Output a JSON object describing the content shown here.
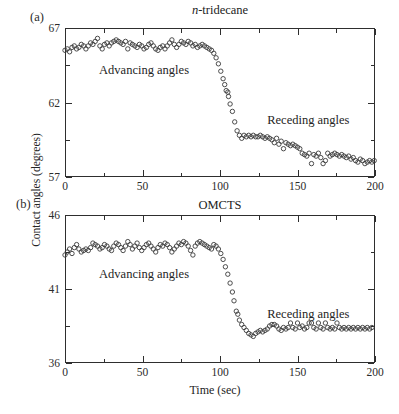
{
  "figure": {
    "xlabel": "Time (sec)",
    "ylabel": "Contact angles (degrees)",
    "background": "#ffffff",
    "ink_color": "#2e2e2e",
    "marker_color": "#3a3a3a"
  },
  "chart_data": [
    {
      "type": "scatter",
      "panel_label": "(a)",
      "title": {
        "italic": "n",
        "rest": "-tridecane"
      },
      "xlim": [
        0,
        200
      ],
      "ylim": [
        57,
        67
      ],
      "x_major_ticks": [
        0,
        50,
        100,
        150,
        200
      ],
      "x_minor_ticks": [
        25,
        75,
        125,
        175
      ],
      "y_major_ticks": [
        57,
        62,
        67
      ],
      "y_minor_ticks": [
        59.5,
        64.5
      ],
      "grid": false,
      "annotations": [
        {
          "text": "Advancing angles",
          "t": 51,
          "value": 64.2
        },
        {
          "text": "Receding angles",
          "t": 157,
          "value": 60.8
        }
      ],
      "points": [
        [
          0,
          65.5
        ],
        [
          1.5,
          65.6
        ],
        [
          3,
          65.4
        ],
        [
          4.5,
          65.7
        ],
        [
          6,
          65.8
        ],
        [
          7.5,
          65.6
        ],
        [
          9,
          65.7
        ],
        [
          10.5,
          65.9
        ],
        [
          12,
          65.8
        ],
        [
          13.5,
          65.6
        ],
        [
          15,
          65.8
        ],
        [
          16.5,
          66.0
        ],
        [
          18,
          65.9
        ],
        [
          19.5,
          66.1
        ],
        [
          21,
          66.3
        ],
        [
          22.5,
          65.8
        ],
        [
          24,
          65.6
        ],
        [
          25.5,
          65.9
        ],
        [
          27,
          66.0
        ],
        [
          28.5,
          65.8
        ],
        [
          30,
          66.0
        ],
        [
          31.5,
          66.1
        ],
        [
          33,
          66.2
        ],
        [
          34.5,
          66.1
        ],
        [
          36,
          66.0
        ],
        [
          37.5,
          65.9
        ],
        [
          39,
          66.1
        ],
        [
          40.5,
          65.6
        ],
        [
          42,
          66.0
        ],
        [
          43.5,
          65.9
        ],
        [
          45,
          65.8
        ],
        [
          46.5,
          65.7
        ],
        [
          48,
          65.9
        ],
        [
          49.5,
          65.8
        ],
        [
          51,
          65.6
        ],
        [
          52.5,
          65.7
        ],
        [
          54,
          65.9
        ],
        [
          55.5,
          66.0
        ],
        [
          57,
          65.8
        ],
        [
          58.5,
          65.6
        ],
        [
          60,
          65.5
        ],
        [
          61.5,
          65.7
        ],
        [
          63,
          65.8
        ],
        [
          64.5,
          65.6
        ],
        [
          66,
          65.8
        ],
        [
          67.5,
          66.0
        ],
        [
          69,
          66.2
        ],
        [
          70.5,
          65.9
        ],
        [
          72,
          65.7
        ],
        [
          73.5,
          65.9
        ],
        [
          75,
          66.1
        ],
        [
          76.5,
          66.0
        ],
        [
          78,
          65.9
        ],
        [
          79.5,
          66.1
        ],
        [
          81,
          66.0
        ],
        [
          82.5,
          65.8
        ],
        [
          84,
          65.9
        ],
        [
          85.5,
          65.7
        ],
        [
          87,
          65.8
        ],
        [
          88.5,
          65.9
        ],
        [
          90,
          65.8
        ],
        [
          91.5,
          65.7
        ],
        [
          93,
          65.6
        ],
        [
          94.5,
          65.5
        ],
        [
          96,
          65.3
        ],
        [
          97.5,
          65.0
        ],
        [
          99,
          64.6
        ],
        [
          100.5,
          64.1
        ],
        [
          102,
          63.6
        ],
        [
          103,
          63.2
        ],
        [
          104,
          62.8
        ],
        [
          105,
          62.7
        ],
        [
          105.5,
          62.4
        ],
        [
          106.5,
          61.9
        ],
        [
          108,
          61.4
        ],
        [
          109.5,
          60.7
        ],
        [
          111,
          60.1
        ],
        [
          112.5,
          59.8
        ],
        [
          114,
          59.6
        ],
        [
          115.5,
          59.8
        ],
        [
          117,
          59.7
        ],
        [
          118.5,
          59.8
        ],
        [
          120,
          59.7
        ],
        [
          121.5,
          59.8
        ],
        [
          123,
          59.7
        ],
        [
          124.5,
          59.7
        ],
        [
          126,
          59.8
        ],
        [
          127.5,
          59.7
        ],
        [
          129,
          59.6
        ],
        [
          130.5,
          59.7
        ],
        [
          132,
          59.6
        ],
        [
          133.5,
          59.5
        ],
        [
          135,
          59.3
        ],
        [
          136.5,
          59.6
        ],
        [
          138,
          59.2
        ],
        [
          139.5,
          59.4
        ],
        [
          141,
          58.9
        ],
        [
          142.5,
          59.3
        ],
        [
          144,
          59.2
        ],
        [
          145.5,
          59.1
        ],
        [
          147,
          59.2
        ],
        [
          148.5,
          59.1
        ],
        [
          150,
          59.0
        ],
        [
          151.5,
          58.9
        ],
        [
          153,
          58.6
        ],
        [
          154.5,
          58.5
        ],
        [
          156,
          58.4
        ],
        [
          157.5,
          58.6
        ],
        [
          159,
          57.9
        ],
        [
          160.5,
          58.5
        ],
        [
          162,
          58.4
        ],
        [
          163.5,
          58.6
        ],
        [
          165,
          58.3
        ],
        [
          166.5,
          57.9
        ],
        [
          168,
          58.1
        ],
        [
          169.5,
          58.6
        ],
        [
          171,
          58.4
        ],
        [
          172.5,
          58.5
        ],
        [
          174,
          58.6
        ],
        [
          175.5,
          58.5
        ],
        [
          177,
          58.4
        ],
        [
          178.5,
          58.5
        ],
        [
          180,
          58.4
        ],
        [
          181.5,
          58.3
        ],
        [
          183,
          58.4
        ],
        [
          184.5,
          58.2
        ],
        [
          186,
          58.3
        ],
        [
          187.5,
          58.1
        ],
        [
          189,
          58.0
        ],
        [
          190.5,
          58.2
        ],
        [
          192,
          58.1
        ],
        [
          193.5,
          57.9
        ],
        [
          195,
          58.0
        ],
        [
          196.5,
          58.1
        ],
        [
          198,
          58.0
        ],
        [
          199.5,
          58.1
        ]
      ]
    },
    {
      "type": "scatter",
      "panel_label": "(b)",
      "title": {
        "italic": "",
        "rest": "OMCTS"
      },
      "xlim": [
        0,
        200
      ],
      "ylim": [
        36,
        46
      ],
      "x_major_ticks": [
        0,
        50,
        100,
        150,
        200
      ],
      "x_minor_ticks": [
        25,
        75,
        125,
        175
      ],
      "y_major_ticks": [
        36,
        41,
        46
      ],
      "y_minor_ticks": [
        38.5,
        43.5
      ],
      "grid": false,
      "annotations": [
        {
          "text": "Advancing angles",
          "t": 51,
          "value": 42.0
        },
        {
          "text": "Receding angles",
          "t": 157,
          "value": 39.3
        }
      ],
      "points": [
        [
          0,
          43.3
        ],
        [
          1.5,
          43.5
        ],
        [
          3,
          43.7
        ],
        [
          4.5,
          43.4
        ],
        [
          6,
          43.8
        ],
        [
          7.5,
          44.0
        ],
        [
          9,
          43.7
        ],
        [
          10.5,
          43.5
        ],
        [
          12,
          43.6
        ],
        [
          13.5,
          43.7
        ],
        [
          15,
          43.6
        ],
        [
          16.5,
          43.8
        ],
        [
          18,
          44.1
        ],
        [
          19.5,
          44.0
        ],
        [
          21,
          43.9
        ],
        [
          22.5,
          43.7
        ],
        [
          24,
          43.8
        ],
        [
          25.5,
          44.0
        ],
        [
          27,
          43.9
        ],
        [
          28.5,
          43.7
        ],
        [
          30,
          43.6
        ],
        [
          31.5,
          43.9
        ],
        [
          33,
          44.1
        ],
        [
          34.5,
          44.0
        ],
        [
          36,
          43.8
        ],
        [
          37.5,
          43.6
        ],
        [
          39,
          43.9
        ],
        [
          40.5,
          44.2
        ],
        [
          42,
          44.0
        ],
        [
          43.5,
          43.7
        ],
        [
          45,
          43.9
        ],
        [
          46.5,
          44.1
        ],
        [
          48,
          43.8
        ],
        [
          49.5,
          43.6
        ],
        [
          51,
          43.8
        ],
        [
          52.5,
          44.0
        ],
        [
          54,
          44.1
        ],
        [
          55.5,
          43.9
        ],
        [
          57,
          43.7
        ],
        [
          58.5,
          43.5
        ],
        [
          60,
          43.8
        ],
        [
          61.5,
          44.0
        ],
        [
          63,
          43.9
        ],
        [
          64.5,
          44.1
        ],
        [
          66,
          44.0
        ],
        [
          67.5,
          43.8
        ],
        [
          69,
          43.5
        ],
        [
          70.5,
          43.7
        ],
        [
          72,
          43.9
        ],
        [
          73.5,
          44.1
        ],
        [
          75,
          44.0
        ],
        [
          76.5,
          44.2
        ],
        [
          78,
          44.1
        ],
        [
          79.5,
          43.9
        ],
        [
          81,
          43.6
        ],
        [
          82.5,
          43.3
        ],
        [
          84,
          43.9
        ],
        [
          85.5,
          44.1
        ],
        [
          87,
          44.2
        ],
        [
          88.5,
          44.1
        ],
        [
          90,
          44.0
        ],
        [
          91.5,
          43.9
        ],
        [
          93,
          43.8
        ],
        [
          94.5,
          43.7
        ],
        [
          96,
          44.0
        ],
        [
          97.5,
          43.9
        ],
        [
          99,
          43.7
        ],
        [
          100.5,
          43.4
        ],
        [
          102,
          43.0
        ],
        [
          103.5,
          42.5
        ],
        [
          105,
          42.0
        ],
        [
          106.5,
          41.4
        ],
        [
          108,
          40.8
        ],
        [
          109,
          40.2
        ],
        [
          110.5,
          39.5
        ],
        [
          111.5,
          39.3
        ],
        [
          112.5,
          38.9
        ],
        [
          114,
          38.6
        ],
        [
          115.5,
          38.4
        ],
        [
          117,
          38.2
        ],
        [
          118.5,
          38.0
        ],
        [
          120,
          37.9
        ],
        [
          121.5,
          37.8
        ],
        [
          123,
          38.0
        ],
        [
          124.5,
          38.1
        ],
        [
          126,
          38.2
        ],
        [
          127.5,
          38.1
        ],
        [
          129,
          38.2
        ],
        [
          130.5,
          38.3
        ],
        [
          132,
          38.5
        ],
        [
          133.5,
          38.6
        ],
        [
          135,
          38.6
        ],
        [
          136.5,
          38.5
        ],
        [
          138,
          38.3
        ],
        [
          139.5,
          38.2
        ],
        [
          141,
          38.4
        ],
        [
          142.5,
          38.3
        ],
        [
          144,
          38.4
        ],
        [
          145.5,
          38.7
        ],
        [
          147,
          38.4
        ],
        [
          148.5,
          38.3
        ],
        [
          150,
          38.7
        ],
        [
          151.5,
          38.4
        ],
        [
          153,
          38.5
        ],
        [
          154.5,
          38.3
        ],
        [
          156,
          38.4
        ],
        [
          157.5,
          38.7
        ],
        [
          159,
          38.7
        ],
        [
          160.5,
          38.4
        ],
        [
          162,
          38.3
        ],
        [
          163.5,
          38.7
        ],
        [
          165,
          38.4
        ],
        [
          166.5,
          38.3
        ],
        [
          168,
          38.7
        ],
        [
          169.5,
          38.4
        ],
        [
          171,
          38.3
        ],
        [
          172.5,
          38.4
        ],
        [
          174,
          38.3
        ],
        [
          175.5,
          38.7
        ],
        [
          177,
          38.4
        ],
        [
          178.5,
          38.3
        ],
        [
          180,
          38.4
        ],
        [
          181.5,
          38.3
        ],
        [
          183,
          38.4
        ],
        [
          184.5,
          38.3
        ],
        [
          186,
          38.4
        ],
        [
          187.5,
          38.3
        ],
        [
          189,
          38.4
        ],
        [
          190.5,
          38.3
        ],
        [
          192,
          38.4
        ],
        [
          193.5,
          38.3
        ],
        [
          195,
          38.4
        ],
        [
          196.5,
          38.3
        ],
        [
          198,
          38.4
        ]
      ]
    }
  ]
}
